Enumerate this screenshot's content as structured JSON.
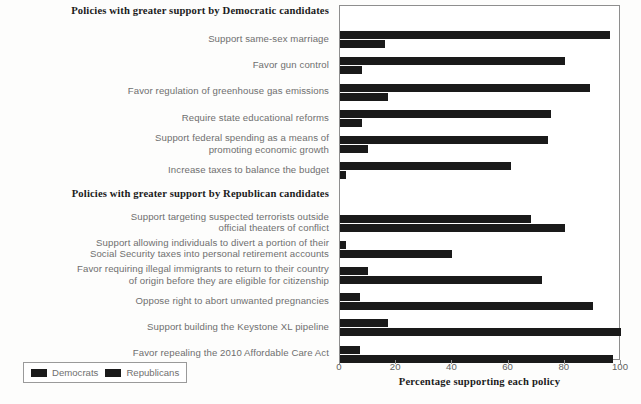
{
  "chart_data": {
    "type": "bar",
    "orientation": "horizontal",
    "title": "",
    "xlabel": "Percentage supporting each policy",
    "ylabel": "",
    "xlim": [
      0,
      100
    ],
    "xticks": [
      0,
      20,
      40,
      60,
      80,
      100
    ],
    "xticklabels": [
      "0",
      "20",
      "40",
      "60",
      "80",
      "100"
    ],
    "grid": false,
    "legend": {
      "position": "lower-left-outside",
      "entries": [
        "Democrats",
        "Republicans"
      ]
    },
    "sections": [
      {
        "header": "Policies with greater support by Democratic candidates",
        "categories": [
          "Support same-sex marriage",
          "Favor gun control",
          "Favor regulation of greenhouse gas emissions",
          "Require state educational reforms",
          "Support federal spending as a means of promoting economic growth",
          "Increase taxes to balance the budget"
        ],
        "series": [
          {
            "name": "Democrats",
            "values": [
              96,
              80,
              89,
              75,
              74,
              61
            ]
          },
          {
            "name": "Republicans",
            "values": [
              16,
              8,
              17,
              8,
              10,
              2
            ]
          }
        ]
      },
      {
        "header": "Policies with greater support by Republican candidates",
        "categories": [
          "Support targeting suspected terrorists outside official theaters of conflict",
          "Support allowing individuals to divert a portion of their Social Security taxes into personal retirement accounts",
          "Favor requiring illegal immigrants to return to their country of origin before they are eligible for citizenship",
          "Oppose right to abort unwanted pregnancies",
          "Support building the Keystone XL pipeline",
          "Favor repealing the 2010 Affordable Care Act"
        ],
        "series": [
          {
            "name": "Democrats",
            "values": [
              68,
              2,
              10,
              7,
              17,
              7
            ]
          },
          {
            "name": "Republicans",
            "values": [
              80,
              40,
              72,
              90,
              100,
              97
            ]
          }
        ]
      }
    ],
    "colors": {
      "bar": "#1a1a1a",
      "frame": "#8e8e8e",
      "label_text": "#6f6f6f",
      "header_text": "#1b1b1b",
      "background": "#ffffff"
    }
  },
  "rows": [
    {
      "kind": "header",
      "text": "Policies with greater support by Democratic candidates"
    },
    {
      "kind": "bars",
      "lines": [
        "Support same-sex marriage"
      ],
      "dem": 96,
      "rep": 16
    },
    {
      "kind": "bars",
      "lines": [
        "Favor gun control"
      ],
      "dem": 80,
      "rep": 8
    },
    {
      "kind": "bars",
      "lines": [
        "Favor regulation of greenhouse gas emissions"
      ],
      "dem": 89,
      "rep": 17
    },
    {
      "kind": "bars",
      "lines": [
        "Require state educational reforms"
      ],
      "dem": 75,
      "rep": 8
    },
    {
      "kind": "bars",
      "lines": [
        "Support federal spending as a means of",
        "promoting economic growth"
      ],
      "dem": 74,
      "rep": 10
    },
    {
      "kind": "bars",
      "lines": [
        "Increase taxes to balance the budget"
      ],
      "dem": 61,
      "rep": 2
    },
    {
      "kind": "header",
      "text": "Policies with greater support by Republican candidates"
    },
    {
      "kind": "bars",
      "lines": [
        "Support targeting suspected terrorists outside",
        "official theaters of conflict"
      ],
      "dem": 68,
      "rep": 80
    },
    {
      "kind": "bars",
      "lines": [
        "Support allowing individuals to divert a portion of their",
        "Social Security taxes into personal retirement accounts"
      ],
      "dem": 2,
      "rep": 40
    },
    {
      "kind": "bars",
      "lines": [
        "Favor requiring illegal immigrants to return to their country",
        "of origin before they are eligible for citizenship"
      ],
      "dem": 10,
      "rep": 72
    },
    {
      "kind": "bars",
      "lines": [
        "Oppose right to abort unwanted pregnancies"
      ],
      "dem": 7,
      "rep": 90
    },
    {
      "kind": "bars",
      "lines": [
        "Support building the Keystone XL pipeline"
      ],
      "dem": 17,
      "rep": 100
    },
    {
      "kind": "bars",
      "lines": [
        "Favor repealing the 2010 Affordable Care Act"
      ],
      "dem": 7,
      "rep": 97
    }
  ],
  "axis": {
    "title": "Percentage supporting each policy",
    "ticks": [
      "0",
      "20",
      "40",
      "60",
      "80",
      "100"
    ]
  },
  "legend": {
    "democrats": "Democrats",
    "republicans": "Republicans"
  }
}
